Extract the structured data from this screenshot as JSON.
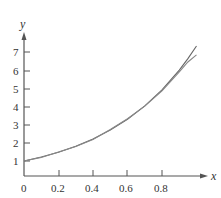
{
  "chart_data": {
    "type": "line",
    "title": "",
    "xlabel": "x",
    "ylabel": "y",
    "xlim": [
      0,
      1
    ],
    "ylim": [
      0,
      7.8
    ],
    "grid": false,
    "legend": null,
    "x_ticks": [
      "0",
      "0.2",
      "0.4",
      "0.6",
      "0.8"
    ],
    "y_ticks": [
      "1",
      "2",
      "3",
      "4",
      "5",
      "6",
      "7"
    ],
    "x": [
      0,
      0.1,
      0.2,
      0.3,
      0.4,
      0.5,
      0.6,
      0.7,
      0.8,
      0.9,
      0.95,
      1.0
    ],
    "series": [
      {
        "name": "curve-1",
        "values": [
          1.0,
          1.22,
          1.49,
          1.82,
          2.23,
          2.72,
          3.32,
          4.06,
          4.95,
          6.05,
          6.69,
          7.39
        ]
      },
      {
        "name": "curve-2",
        "values": [
          1.0,
          1.2,
          1.5,
          1.8,
          2.2,
          2.75,
          3.35,
          4.05,
          4.9,
          5.95,
          6.5,
          6.9
        ]
      }
    ]
  },
  "axes": {
    "x_label": "x",
    "y_label": "y",
    "x_tick_labels": [
      "0",
      "0.2",
      "0.4",
      "0.6",
      "0.8"
    ],
    "y_tick_labels": [
      "1",
      "2",
      "3",
      "4",
      "5",
      "6",
      "7"
    ]
  }
}
